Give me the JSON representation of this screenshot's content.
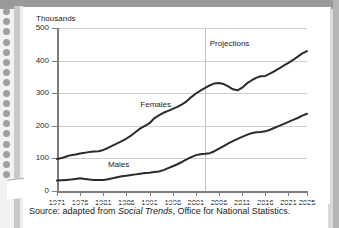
{
  "page": {
    "background": "#ffffff",
    "binding_dots": 17,
    "margin_color": "#9a9a9a"
  },
  "chart_data": {
    "type": "line",
    "title": "",
    "subtitle": "",
    "xlabel": "",
    "ylabel": "Thousands",
    "ylim": [
      0,
      500
    ],
    "xlim": [
      1971,
      2025
    ],
    "yticks": [
      0,
      100,
      200,
      300,
      400,
      500
    ],
    "ytick_labels": [
      "0",
      "100",
      "200",
      "300",
      "400",
      "500"
    ],
    "xticks": [
      1971,
      1976,
      1981,
      1986,
      1991,
      1996,
      2001,
      2006,
      2011,
      2016,
      2021,
      2025
    ],
    "xtick_labels": [
      "1971",
      "1976",
      "1981",
      "1986",
      "1991",
      "1996",
      "2001",
      "2006",
      "2011",
      "2016",
      "2021",
      "2025"
    ],
    "grid": true,
    "grid_axis": "y",
    "legend": "inline-labels",
    "line_color": "#2b2b2b",
    "annotations": [
      {
        "text": "Projections",
        "x": 2004,
        "y": 455
      },
      {
        "text": "Females",
        "x": 1989,
        "y": 268
      },
      {
        "text": "Males",
        "x": 1982,
        "y": 82
      }
    ],
    "vertical_rules": [
      {
        "label": "projection-start",
        "x": 2003,
        "color": "#c0c0c0"
      }
    ],
    "x": [
      1971,
      1972,
      1973,
      1974,
      1975,
      1976,
      1977,
      1978,
      1979,
      1980,
      1981,
      1982,
      1983,
      1984,
      1985,
      1986,
      1987,
      1988,
      1989,
      1990,
      1991,
      1992,
      1993,
      1994,
      1995,
      1996,
      1997,
      1998,
      1999,
      2000,
      2001,
      2002,
      2003,
      2004,
      2005,
      2006,
      2007,
      2008,
      2009,
      2010,
      2011,
      2012,
      2013,
      2014,
      2015,
      2016,
      2017,
      2018,
      2019,
      2020,
      2021,
      2022,
      2023,
      2024,
      2025
    ],
    "series": [
      {
        "name": "Females",
        "values": [
          98,
          101,
          106,
          110,
          112,
          115,
          117,
          120,
          121,
          122,
          126,
          132,
          139,
          146,
          153,
          161,
          170,
          181,
          192,
          200,
          208,
          223,
          232,
          240,
          246,
          252,
          258,
          266,
          275,
          288,
          299,
          308,
          316,
          324,
          330,
          331,
          328,
          321,
          312,
          309,
          317,
          330,
          339,
          347,
          352,
          353,
          360,
          368,
          376,
          385,
          393,
          402,
          412,
          422,
          429
        ]
      },
      {
        "name": "Males",
        "values": [
          32,
          33,
          34,
          35,
          37,
          39,
          37,
          35,
          34,
          34,
          34,
          36,
          39,
          42,
          45,
          47,
          49,
          51,
          53,
          55,
          56,
          58,
          60,
          64,
          70,
          76,
          82,
          89,
          97,
          104,
          110,
          113,
          114,
          116,
          122,
          130,
          138,
          146,
          153,
          160,
          166,
          172,
          177,
          180,
          181,
          183,
          188,
          194,
          200,
          206,
          212,
          218,
          224,
          231,
          237
        ]
      }
    ]
  },
  "source": {
    "prefix": "Source: adapted from ",
    "italic": "Social Trends",
    "suffix": ", Office for National Statistics."
  }
}
